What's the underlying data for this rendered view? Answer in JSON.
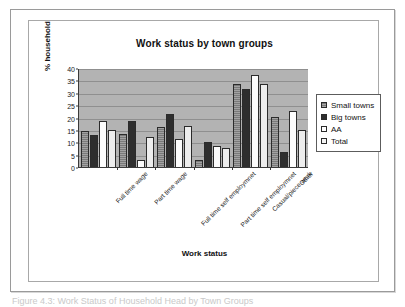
{
  "figure": {
    "caption": "Figure 4.3: Work Status of Household Head by Town Groups"
  },
  "chart_data": {
    "type": "bar",
    "title": "Work status by town groups",
    "xlabel": "Work status",
    "ylabel": "% household",
    "ylim": [
      0,
      40
    ],
    "yticks": [
      0,
      5,
      10,
      15,
      20,
      25,
      30,
      35,
      40
    ],
    "grid": true,
    "legend_position": "right",
    "categories": [
      "Full time wage",
      "Part time wage",
      "Full time self employmnet",
      "Part time self employmnet",
      "Casual/piece work",
      "Other"
    ],
    "series": [
      {
        "name": "Small towns",
        "color": "#7a7a7a",
        "values": [
          14.5,
          13.5,
          16.0,
          2.8,
          33.5,
          20.2
        ]
      },
      {
        "name": "Big towns",
        "color": "#2e2e2e",
        "values": [
          13.0,
          18.5,
          21.5,
          10.0,
          31.5,
          6.0
        ]
      },
      {
        "name": "AA",
        "color": "#fcfcfc",
        "values": [
          18.5,
          2.8,
          11.3,
          8.5,
          37.0,
          22.5
        ]
      },
      {
        "name": "Total",
        "color": "#ededed",
        "values": [
          15.0,
          12.2,
          16.5,
          7.5,
          33.5,
          15.0
        ]
      }
    ]
  }
}
